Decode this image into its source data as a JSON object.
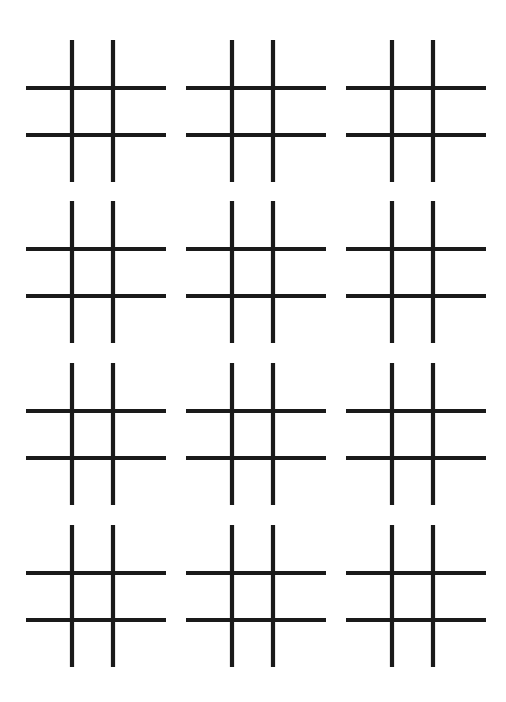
{
  "page": {
    "width": 506,
    "height": 702,
    "background_color": "#ffffff",
    "ink_color": "#1a1a1a"
  },
  "layout": {
    "columns": 3,
    "rows": 4,
    "grid_count": 12,
    "column_origins_x": [
      20,
      180,
      340
    ],
    "row_origins_y": [
      40,
      201,
      363,
      525
    ],
    "column_pitch": 160,
    "row_pitch": 161
  },
  "grid_geometry": {
    "cell_width": 152,
    "cell_height": 144,
    "stroke_width": 4.2,
    "stroke_color": "#1a1a1a",
    "vertical_lines_x": [
      52,
      93
    ],
    "vertical_span_y": [
      0,
      142
    ],
    "horizontal_lines_y": [
      48,
      95
    ],
    "horizontal_span_x": [
      6,
      146
    ]
  },
  "grids": [
    {
      "id": "grid-1",
      "row": 1,
      "column": 1,
      "label": "Grid 1",
      "x": 20,
      "y": 40,
      "state": "empty"
    },
    {
      "id": "grid-2",
      "row": 1,
      "column": 2,
      "label": "Grid 2",
      "x": 180,
      "y": 40,
      "state": "empty"
    },
    {
      "id": "grid-3",
      "row": 1,
      "column": 3,
      "label": "Grid 3",
      "x": 340,
      "y": 40,
      "state": "empty"
    },
    {
      "id": "grid-4",
      "row": 2,
      "column": 1,
      "label": "Grid 4",
      "x": 20,
      "y": 201,
      "state": "empty"
    },
    {
      "id": "grid-5",
      "row": 2,
      "column": 2,
      "label": "Grid 5",
      "x": 180,
      "y": 201,
      "state": "empty"
    },
    {
      "id": "grid-6",
      "row": 2,
      "column": 3,
      "label": "Grid 6",
      "x": 340,
      "y": 201,
      "state": "empty"
    },
    {
      "id": "grid-7",
      "row": 3,
      "column": 1,
      "label": "Grid 7",
      "x": 20,
      "y": 363,
      "state": "empty"
    },
    {
      "id": "grid-8",
      "row": 3,
      "column": 2,
      "label": "Grid 8",
      "x": 180,
      "y": 363,
      "state": "empty"
    },
    {
      "id": "grid-9",
      "row": 3,
      "column": 3,
      "label": "Grid 9",
      "x": 340,
      "y": 363,
      "state": "empty"
    },
    {
      "id": "grid-10",
      "row": 4,
      "column": 1,
      "label": "Grid 10",
      "x": 20,
      "y": 525,
      "state": "empty"
    },
    {
      "id": "grid-11",
      "row": 4,
      "column": 2,
      "label": "Grid 11",
      "x": 180,
      "y": 525,
      "state": "empty"
    },
    {
      "id": "grid-12",
      "row": 4,
      "column": 3,
      "label": "Grid 12",
      "x": 340,
      "y": 525,
      "state": "empty"
    }
  ]
}
